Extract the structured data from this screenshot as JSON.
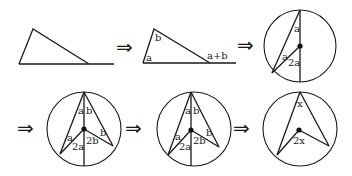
{
  "diagram": {
    "arrow_glyph": "⇒",
    "panels": [
      {
        "id": "triangle-plain",
        "labels": []
      },
      {
        "id": "triangle-exterior-angle",
        "labels": {
          "apex": "b",
          "base_left": "a",
          "exterior": "a+b"
        }
      },
      {
        "id": "circle-diameter-case",
        "labels": {
          "top": "a",
          "left": "a",
          "center": "2a"
        }
      },
      {
        "id": "circle-split-case-1",
        "labels": {
          "top_left": "a",
          "top_right": "b",
          "left": "a",
          "right": "b",
          "center_left": "2a",
          "center_right": "2b"
        }
      },
      {
        "id": "circle-split-case-2",
        "labels": {
          "top_left": "a",
          "top_right": "b",
          "left": "a",
          "right": "b",
          "center_left": "2a",
          "center_right": "2b"
        }
      },
      {
        "id": "circle-general",
        "labels": {
          "inscribed": "x",
          "central": "2x"
        }
      }
    ]
  }
}
